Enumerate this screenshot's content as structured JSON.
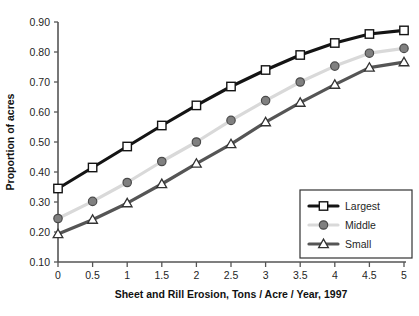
{
  "chart_data": {
    "type": "line",
    "title": "",
    "xlabel": "Sheet and Rill Erosion, Tons / Acre / Year, 1997",
    "ylabel": "Proportion of acres",
    "x": [
      0,
      0.5,
      1,
      1.5,
      2,
      2.5,
      3,
      3.5,
      4,
      4.5,
      5
    ],
    "xticklabels": [
      "0",
      "0.5",
      "1",
      "1.5",
      "2",
      "2.5",
      "3",
      "3.5",
      "4",
      "4.5",
      "5"
    ],
    "yticks": [
      0.1,
      0.2,
      0.3,
      0.4,
      0.5,
      0.6,
      0.7,
      0.8,
      0.9
    ],
    "yticklabels": [
      "0.10",
      "0.20",
      "0.30",
      "0.40",
      "0.50",
      "0.60",
      "0.70",
      "0.80",
      "0.90"
    ],
    "xlim": [
      0,
      5
    ],
    "ylim": [
      0.1,
      0.9
    ],
    "grid": false,
    "legend_position": "lower right",
    "series": [
      {
        "name": "Largest",
        "color": "#141414",
        "marker": "square",
        "marker_fill": "#ffffff",
        "values": [
          0.345,
          0.415,
          0.485,
          0.555,
          0.622,
          0.685,
          0.74,
          0.79,
          0.83,
          0.86,
          0.872
        ]
      },
      {
        "name": "Middle",
        "color": "#d9d9d9",
        "marker": "circle",
        "marker_fill": "#808080",
        "values": [
          0.245,
          0.302,
          0.365,
          0.435,
          0.5,
          0.572,
          0.638,
          0.7,
          0.753,
          0.796,
          0.812
        ]
      },
      {
        "name": "Small",
        "color": "#555555",
        "marker": "triangle",
        "marker_fill": "#ffffff",
        "values": [
          0.193,
          0.241,
          0.296,
          0.36,
          0.428,
          0.493,
          0.566,
          0.631,
          0.691,
          0.748,
          0.766
        ]
      }
    ]
  },
  "legend": {
    "items": [
      {
        "label": "Largest"
      },
      {
        "label": "Middle"
      },
      {
        "label": "Small"
      }
    ]
  }
}
